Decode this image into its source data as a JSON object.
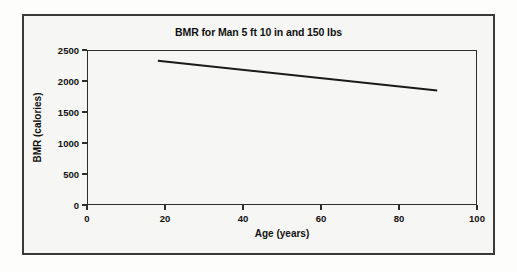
{
  "chart_data": {
    "type": "line",
    "title": "BMR for Man 5 ft 10 in and 150 lbs",
    "xlabel": "Age (years)",
    "ylabel": "BMR (calories)",
    "xlim": [
      0,
      100
    ],
    "ylim": [
      0,
      2500
    ],
    "xticks": [
      "0",
      "20",
      "40",
      "60",
      "80",
      "100"
    ],
    "xtick_values": [
      0,
      20,
      40,
      60,
      80,
      100
    ],
    "yticks": [
      "0",
      "500",
      "1000",
      "1500",
      "2000",
      "2500"
    ],
    "ytick_values": [
      0,
      500,
      1000,
      1500,
      2000,
      2500
    ],
    "grid": false,
    "legend": null,
    "line_color": "#1a1a1a",
    "series": [
      {
        "name": "BMR",
        "x": [
          18,
          90
        ],
        "values": [
          2340,
          1855
        ]
      }
    ]
  },
  "figure": {
    "background_color": "#f6f6f4",
    "border_color": "#3a3a3a",
    "axis_color": "#2e2e2e"
  }
}
